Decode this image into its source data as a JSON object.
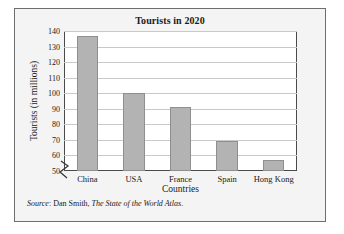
{
  "chart_data": {
    "type": "bar",
    "title": "Tourists in 2020",
    "xlabel": "Countries",
    "ylabel": "Tourists (in millions)",
    "categories": [
      "China",
      "USA",
      "France",
      "Spain",
      "Hong Kong"
    ],
    "values": [
      137,
      100,
      91,
      69,
      57
    ],
    "ylim": [
      50,
      140
    ],
    "ytick_step": 10,
    "yticks": [
      50,
      60,
      70,
      80,
      90,
      100,
      110,
      120,
      130,
      140
    ],
    "axis_break": true,
    "grid": "horizontal",
    "legend": "none",
    "bar_color": "#b3b3b3",
    "plot_background": "#ffffff",
    "figure_background": "#f4f4f4"
  },
  "source": {
    "label": "Source",
    "separator": ": ",
    "author": "Dan Smith, ",
    "work": "The State of the World Atlas",
    "period": "."
  }
}
